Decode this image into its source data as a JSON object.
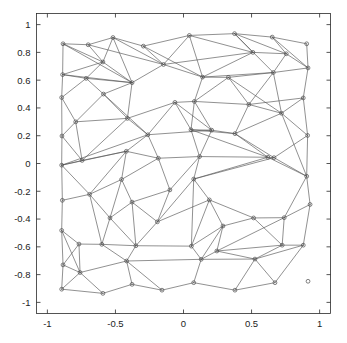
{
  "figure": {
    "type": "mesh-plot",
    "background_color": "#ffffff",
    "width": 347,
    "height": 343
  },
  "chart_data": {
    "type": "scatter",
    "title": "",
    "subtitle": "",
    "xlabel": "",
    "ylabel": "",
    "xlim": [
      -1.08,
      1.08
    ],
    "ylim": [
      -1.08,
      1.08
    ],
    "grid": false,
    "legend": null,
    "marker": "circle-open",
    "marker_color": "#4a4a4a",
    "edge_color": "#555555",
    "xticks": [
      -1,
      -0.5,
      0,
      0.5,
      1
    ],
    "xticklabels": [
      "-1",
      "-0.5",
      "0",
      "0.5",
      "1"
    ],
    "yticks": [
      1,
      0.8,
      0.6,
      0.4,
      0.2,
      0,
      -0.2,
      -0.4,
      -0.6,
      -0.8,
      -1
    ],
    "yticklabels": [
      "1",
      "0.8",
      "0.6",
      "0.4",
      "0.2",
      "0",
      "-0.2",
      "-0.4",
      "-0.6",
      "-0.8",
      "-1"
    ],
    "nodes": [
      [
        -0.885,
        0.862
      ],
      [
        -0.7,
        0.855
      ],
      [
        -0.518,
        0.907
      ],
      [
        -0.295,
        0.845
      ],
      [
        0.043,
        0.922
      ],
      [
        0.375,
        0.935
      ],
      [
        0.652,
        0.91
      ],
      [
        0.905,
        0.862
      ],
      [
        -0.888,
        0.64
      ],
      [
        -0.592,
        0.731
      ],
      [
        -0.147,
        0.713
      ],
      [
        0.51,
        0.8
      ],
      [
        0.755,
        0.79
      ],
      [
        0.915,
        0.688
      ],
      [
        -0.895,
        0.475
      ],
      [
        -0.715,
        0.613
      ],
      [
        -0.378,
        0.582
      ],
      [
        0.14,
        0.622
      ],
      [
        0.33,
        0.62
      ],
      [
        0.66,
        0.655
      ],
      [
        -0.792,
        0.3
      ],
      [
        -0.588,
        0.5
      ],
      [
        -0.412,
        0.325
      ],
      [
        -0.063,
        0.44
      ],
      [
        0.08,
        0.447
      ],
      [
        0.48,
        0.425
      ],
      [
        0.88,
        0.472
      ],
      [
        -0.893,
        0.198
      ],
      [
        -0.745,
        0.022
      ],
      [
        -0.262,
        0.207
      ],
      [
        0.207,
        0.24
      ],
      [
        0.055,
        0.243
      ],
      [
        0.378,
        0.215
      ],
      [
        0.72,
        0.362
      ],
      [
        0.912,
        0.202
      ],
      [
        -0.895,
        -0.012
      ],
      [
        -0.42,
        0.088
      ],
      [
        -0.185,
        0.038
      ],
      [
        0.118,
        0.05
      ],
      [
        0.62,
        0.045
      ],
      [
        0.665,
        0.042
      ],
      [
        -0.89,
        -0.265
      ],
      [
        -0.69,
        -0.222
      ],
      [
        -0.455,
        -0.115
      ],
      [
        -0.1,
        -0.19
      ],
      [
        0.075,
        -0.112
      ],
      [
        0.905,
        -0.092
      ],
      [
        -0.54,
        -0.392
      ],
      [
        -0.378,
        -0.278
      ],
      [
        -0.192,
        -0.42
      ],
      [
        0.19,
        -0.262
      ],
      [
        0.515,
        -0.392
      ],
      [
        0.74,
        -0.39
      ],
      [
        0.93,
        -0.295
      ],
      [
        -0.895,
        -0.482
      ],
      [
        -0.768,
        -0.58
      ],
      [
        -0.6,
        -0.582
      ],
      [
        -0.35,
        -0.592
      ],
      [
        0.058,
        -0.595
      ],
      [
        0.29,
        -0.45
      ],
      [
        0.245,
        -0.63
      ],
      [
        0.725,
        -0.588
      ],
      [
        0.88,
        -0.588
      ],
      [
        -0.885,
        -0.73
      ],
      [
        -0.76,
        -0.785
      ],
      [
        -0.418,
        -0.702
      ],
      [
        0.13,
        -0.69
      ],
      [
        0.525,
        -0.688
      ],
      [
        -0.895,
        -0.905
      ],
      [
        -0.592,
        -0.935
      ],
      [
        -0.378,
        -0.87
      ],
      [
        -0.158,
        -0.912
      ],
      [
        0.075,
        -0.858
      ],
      [
        0.378,
        -0.912
      ],
      [
        0.672,
        -0.858
      ],
      [
        0.915,
        -0.848
      ]
    ],
    "edges": [
      [
        0,
        1
      ],
      [
        1,
        2
      ],
      [
        2,
        3
      ],
      [
        3,
        4
      ],
      [
        4,
        5
      ],
      [
        5,
        6
      ],
      [
        6,
        7
      ],
      [
        0,
        8
      ],
      [
        8,
        14
      ],
      [
        14,
        27
      ],
      [
        27,
        35
      ],
      [
        35,
        41
      ],
      [
        41,
        54
      ],
      [
        54,
        63
      ],
      [
        63,
        68
      ],
      [
        7,
        13
      ],
      [
        13,
        26
      ],
      [
        26,
        34
      ],
      [
        34,
        46
      ],
      [
        46,
        53
      ],
      [
        53,
        62
      ],
      [
        62,
        74
      ],
      [
        68,
        69
      ],
      [
        69,
        70
      ],
      [
        70,
        71
      ],
      [
        71,
        72
      ],
      [
        72,
        73
      ],
      [
        73,
        74
      ],
      [
        0,
        9
      ],
      [
        1,
        9
      ],
      [
        2,
        9
      ],
      [
        0,
        16
      ],
      [
        8,
        15
      ],
      [
        9,
        15
      ],
      [
        8,
        9
      ],
      [
        2,
        10
      ],
      [
        3,
        10
      ],
      [
        4,
        10
      ],
      [
        3,
        17
      ],
      [
        4,
        17
      ],
      [
        4,
        11
      ],
      [
        5,
        11
      ],
      [
        5,
        12
      ],
      [
        11,
        12
      ],
      [
        6,
        12
      ],
      [
        6,
        13
      ],
      [
        12,
        13
      ],
      [
        12,
        19
      ],
      [
        13,
        19
      ],
      [
        9,
        16
      ],
      [
        10,
        16
      ],
      [
        10,
        17
      ],
      [
        15,
        16
      ],
      [
        14,
        15
      ],
      [
        15,
        21
      ],
      [
        16,
        21
      ],
      [
        16,
        22
      ],
      [
        17,
        18
      ],
      [
        18,
        19
      ],
      [
        17,
        24
      ],
      [
        18,
        24
      ],
      [
        19,
        25
      ],
      [
        19,
        33
      ],
      [
        14,
        20
      ],
      [
        20,
        21
      ],
      [
        21,
        22
      ],
      [
        22,
        23
      ],
      [
        23,
        24
      ],
      [
        24,
        25
      ],
      [
        25,
        26
      ],
      [
        20,
        22
      ],
      [
        20,
        28
      ],
      [
        27,
        28
      ],
      [
        27,
        20
      ],
      [
        22,
        29
      ],
      [
        23,
        29
      ],
      [
        23,
        31
      ],
      [
        24,
        31
      ],
      [
        31,
        30
      ],
      [
        30,
        29
      ],
      [
        30,
        32
      ],
      [
        25,
        32
      ],
      [
        25,
        33
      ],
      [
        26,
        33
      ],
      [
        26,
        34
      ],
      [
        33,
        34
      ],
      [
        32,
        33
      ],
      [
        29,
        36
      ],
      [
        28,
        36
      ],
      [
        28,
        35
      ],
      [
        35,
        36
      ],
      [
        36,
        37
      ],
      [
        37,
        38
      ],
      [
        38,
        39
      ],
      [
        39,
        40
      ],
      [
        40,
        34
      ],
      [
        29,
        37
      ],
      [
        30,
        38
      ],
      [
        32,
        39
      ],
      [
        32,
        40
      ],
      [
        34,
        40
      ],
      [
        36,
        43
      ],
      [
        35,
        42
      ],
      [
        42,
        43
      ],
      [
        41,
        42
      ],
      [
        37,
        43
      ],
      [
        37,
        44
      ],
      [
        38,
        44
      ],
      [
        38,
        45
      ],
      [
        39,
        45
      ],
      [
        39,
        46
      ],
      [
        40,
        46
      ],
      [
        43,
        47
      ],
      [
        43,
        48
      ],
      [
        42,
        47
      ],
      [
        41,
        54
      ],
      [
        42,
        56
      ],
      [
        47,
        56
      ],
      [
        47,
        57
      ],
      [
        48,
        44
      ],
      [
        44,
        49
      ],
      [
        45,
        49
      ],
      [
        45,
        50
      ],
      [
        46,
        52
      ],
      [
        46,
        53
      ],
      [
        50,
        51
      ],
      [
        48,
        49
      ],
      [
        49,
        57
      ],
      [
        50,
        58
      ],
      [
        45,
        58
      ],
      [
        50,
        59
      ],
      [
        51,
        59
      ],
      [
        51,
        52
      ],
      [
        52,
        61
      ],
      [
        53,
        62
      ],
      [
        52,
        53
      ],
      [
        51,
        61
      ],
      [
        54,
        55
      ],
      [
        55,
        56
      ],
      [
        56,
        57
      ],
      [
        57,
        58
      ],
      [
        58,
        59
      ],
      [
        59,
        60
      ],
      [
        60,
        61
      ],
      [
        61,
        62
      ],
      [
        54,
        64
      ],
      [
        55,
        64
      ],
      [
        55,
        63
      ],
      [
        56,
        65
      ],
      [
        57,
        65
      ],
      [
        58,
        66
      ],
      [
        59,
        66
      ],
      [
        60,
        66
      ],
      [
        61,
        67
      ],
      [
        62,
        67
      ],
      [
        63,
        64
      ],
      [
        64,
        65
      ],
      [
        65,
        66
      ],
      [
        66,
        67
      ],
      [
        63,
        68
      ],
      [
        64,
        69
      ],
      [
        65,
        70
      ],
      [
        65,
        71
      ],
      [
        66,
        72
      ],
      [
        67,
        73
      ],
      [
        67,
        74
      ],
      [
        68,
        69
      ],
      [
        64,
        68
      ],
      [
        69,
        70
      ],
      [
        70,
        71
      ],
      [
        71,
        72
      ],
      [
        72,
        73
      ],
      [
        73,
        74
      ],
      [
        60,
        67
      ],
      [
        48,
        57
      ],
      [
        44,
        48
      ],
      [
        23,
        30
      ],
      [
        21,
        29
      ],
      [
        10,
        11
      ],
      [
        11,
        17
      ],
      [
        18,
        33
      ],
      [
        31,
        32
      ],
      [
        31,
        39
      ],
      [
        31,
        38
      ],
      [
        36,
        42
      ],
      [
        47,
        48
      ],
      [
        49,
        50
      ],
      [
        52,
        60
      ],
      [
        70,
        65
      ],
      [
        2,
        16
      ],
      [
        17,
        19
      ],
      [
        8,
        16
      ],
      [
        7,
        6
      ],
      [
        5,
        19
      ],
      [
        33,
        46
      ],
      [
        40,
        45
      ],
      [
        1,
        10
      ],
      [
        20,
        27
      ],
      [
        22,
        28
      ],
      [
        24,
        30
      ],
      [
        25,
        18
      ],
      [
        29,
        35
      ]
    ]
  },
  "axes": {
    "box_color": "#2a2a2a",
    "tick_color": "#2a2a2a",
    "label_color": "#1c1c1c"
  },
  "caption_fragment": ""
}
